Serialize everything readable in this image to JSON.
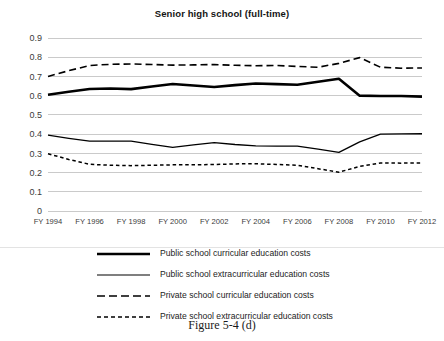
{
  "chart_data": {
    "type": "line",
    "title": "Senior high school (full-time)",
    "xlabel": "",
    "ylabel": "",
    "ylim": [
      0,
      0.9
    ],
    "yticks": [
      "0",
      "0.1",
      "0.2",
      "0.3",
      "0.4",
      "0.5",
      "0.6",
      "0.7",
      "0.8",
      "0.9"
    ],
    "grid": true,
    "legend_position": "below",
    "x": [
      "FY 1994",
      "FY 1995",
      "FY 1996",
      "FY 1997",
      "FY 1998",
      "FY 1999",
      "FY 2000",
      "FY 2001",
      "FY 2002",
      "FY 2003",
      "FY 2004",
      "FY 2005",
      "FY 2006",
      "FY 2007",
      "FY 2008",
      "FY 2009",
      "FY 2010",
      "FY 2011",
      "FY 2012"
    ],
    "xtick_labels": [
      "FY 1994",
      "FY 1996",
      "FY 1998",
      "FY 2000",
      "FY 2002",
      "FY 2004",
      "FY 2006",
      "FY 2008",
      "FY 2010",
      "FY 2012"
    ],
    "series": [
      {
        "name": "Public school curricular education costs",
        "style": "thick-solid",
        "values": [
          0.605,
          0.62,
          0.635,
          0.637,
          0.634,
          0.648,
          0.661,
          0.653,
          0.645,
          0.655,
          0.663,
          0.66,
          0.657,
          0.672,
          0.688,
          0.6,
          0.598,
          0.598,
          0.595
        ]
      },
      {
        "name": "Public school extracurricular education costs",
        "style": "thin-solid",
        "values": [
          0.395,
          0.378,
          0.363,
          0.364,
          0.364,
          0.347,
          0.331,
          0.344,
          0.356,
          0.346,
          0.339,
          0.337,
          0.337,
          0.322,
          0.305,
          0.36,
          0.4,
          0.401,
          0.402
        ]
      },
      {
        "name": "Private school curricular education costs",
        "style": "long-dash",
        "values": [
          0.7,
          0.73,
          0.757,
          0.763,
          0.765,
          0.762,
          0.759,
          0.76,
          0.762,
          0.758,
          0.756,
          0.757,
          0.752,
          0.748,
          0.768,
          0.798,
          0.748,
          0.743,
          0.744
        ]
      },
      {
        "name": "Private school extracurricular education costs",
        "style": "short-dash",
        "values": [
          0.298,
          0.268,
          0.243,
          0.238,
          0.236,
          0.238,
          0.24,
          0.24,
          0.242,
          0.245,
          0.246,
          0.242,
          0.238,
          0.22,
          0.202,
          0.232,
          0.25,
          0.249,
          0.25
        ]
      }
    ]
  },
  "legend": {
    "items": [
      {
        "label": "Public school curricular education costs",
        "style": "thick-solid"
      },
      {
        "label": "Public school extracurricular education costs",
        "style": "thin-solid"
      },
      {
        "label": "Private school curricular education costs",
        "style": "long-dash"
      },
      {
        "label": "Private school extracurricular education costs",
        "style": "short-dash"
      }
    ]
  },
  "caption": "Figure 5-4 (d)"
}
